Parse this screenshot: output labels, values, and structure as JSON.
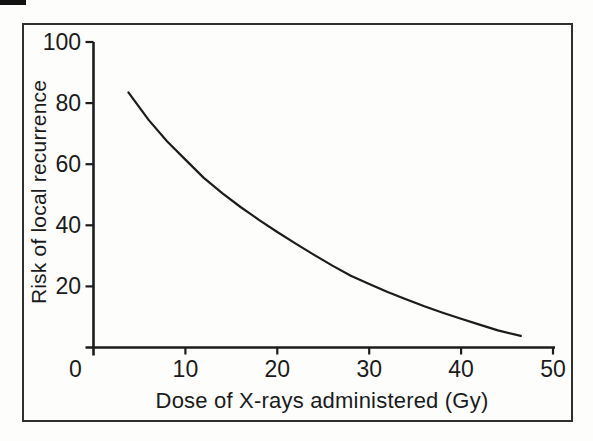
{
  "figure": {
    "background": "#fdfdfc",
    "ink_color": "#1c1c1c",
    "frame_color": "#2f2f2f"
  },
  "chart_data": {
    "type": "line",
    "title": "",
    "xlabel": "Dose of X-rays administered (Gy)",
    "ylabel": "Risk of local recurrence",
    "xlim": [
      0,
      50
    ],
    "ylim": [
      0,
      100
    ],
    "x_ticks": [
      0,
      10,
      20,
      30,
      40,
      50
    ],
    "y_ticks": [
      20,
      40,
      60,
      80,
      100
    ],
    "grid": false,
    "legend": "none",
    "line_color": "#1c1c1c",
    "series": [
      {
        "name": "risk-of-local-recurrence-curve",
        "points": [
          [
            3.8,
            83.5
          ],
          [
            6,
            74.5
          ],
          [
            8,
            67.5
          ],
          [
            10,
            61.5
          ],
          [
            12,
            55.5
          ],
          [
            14,
            50.5
          ],
          [
            16,
            46.0
          ],
          [
            18,
            41.8
          ],
          [
            20,
            37.8
          ],
          [
            22,
            34.0
          ],
          [
            24,
            30.3
          ],
          [
            26,
            26.8
          ],
          [
            28,
            23.5
          ],
          [
            30,
            20.8
          ],
          [
            32,
            18.2
          ],
          [
            34,
            15.8
          ],
          [
            36,
            13.5
          ],
          [
            38,
            11.4
          ],
          [
            40,
            9.4
          ],
          [
            42,
            7.5
          ],
          [
            44,
            5.6
          ],
          [
            46.5,
            3.8
          ]
        ]
      }
    ]
  }
}
